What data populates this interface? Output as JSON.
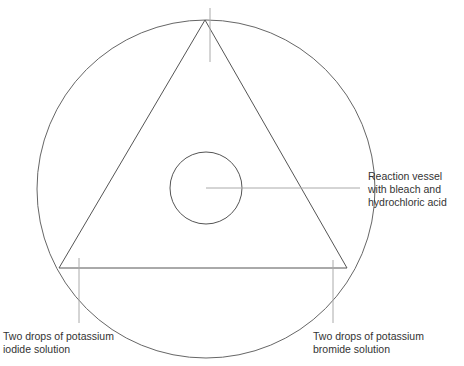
{
  "diagram": {
    "type": "experiment-setup-diagram",
    "colors": {
      "stroke": "#555555",
      "leader": "#aaaaaa",
      "text": "#333333",
      "background": "#ffffff"
    },
    "labels": {
      "vessel": {
        "line1": "Reaction vessel",
        "line2": "with bleach and",
        "line3": "hydrochloric acid"
      },
      "iodide": {
        "line1": "Two drops of potassium",
        "line2": "iodide solution"
      },
      "bromide": {
        "line1": "Two drops of potassium",
        "line2": "bromide solution"
      }
    }
  }
}
